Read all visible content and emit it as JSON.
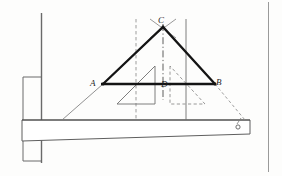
{
  "figure": {
    "labels": {
      "A": "A",
      "B": "B",
      "C": "C",
      "D": "D"
    },
    "colors": {
      "ink": "#1d1d1d",
      "bold_ink": "#111111",
      "thin_ink": "#4a4a4a",
      "faint_ink": "#8d8d8d",
      "paper": "#fdfdfc",
      "border": "#9a9a9a"
    },
    "geometry": {
      "apex_C": [
        163,
        27
      ],
      "vertex_A": [
        103,
        84
      ],
      "vertex_B": [
        215,
        84
      ],
      "point_D": [
        163,
        84
      ],
      "beam_top_y": 120,
      "beam_left_x": 22,
      "beam_right_x": 250,
      "wall_x": 41,
      "hole": [
        238,
        127
      ]
    },
    "elements": [
      {
        "name": "wall-line",
        "kind": "solid-thin"
      },
      {
        "name": "wall-plate-upper",
        "kind": "solid-thin"
      },
      {
        "name": "wall-plate-lower",
        "kind": "solid-thin"
      },
      {
        "name": "bracket-beam",
        "kind": "solid-thin-tapered"
      },
      {
        "name": "beam-hole",
        "kind": "small-circle"
      },
      {
        "name": "triangle-ABC",
        "kind": "solid-bold"
      },
      {
        "name": "base-AB",
        "kind": "solid-bold"
      },
      {
        "name": "centerline-CD",
        "kind": "dash-dot"
      },
      {
        "name": "dashed-vertical-left",
        "kind": "dashed-thin"
      },
      {
        "name": "solid-vertical-right",
        "kind": "solid-thin"
      },
      {
        "name": "guide-A-to-beam",
        "kind": "solid-thin"
      },
      {
        "name": "guide-B-to-beam",
        "kind": "dashed-thin"
      },
      {
        "name": "inner-triangle-left",
        "kind": "solid-thin"
      },
      {
        "name": "inner-triangle-right",
        "kind": "dashed-thin"
      },
      {
        "name": "frame-border-right",
        "kind": "solid-thin"
      }
    ]
  }
}
